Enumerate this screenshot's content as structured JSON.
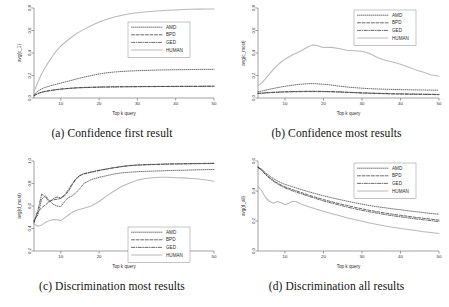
{
  "figure": {
    "panels": [
      {
        "id": "a",
        "caption": "(a) Confidence first result",
        "ylabel": "avg(c_1)",
        "xlabel": "Top k query"
      },
      {
        "id": "b",
        "caption": "(b) Confidence most results",
        "ylabel": "avg(c_most)",
        "xlabel": "Top k query"
      },
      {
        "id": "c",
        "caption": "(c) Discrimination most results",
        "ylabel": "avg(d_most)",
        "xlabel": "Top k query"
      },
      {
        "id": "d",
        "caption": "(d) Discrimination all results",
        "ylabel": "avg(d_all)",
        "xlabel": "Top k query"
      }
    ],
    "legend": {
      "entries": [
        "AMD",
        "BPD",
        "GED",
        "HUMAN"
      ]
    },
    "colors": {
      "amd": "#3a3a3a",
      "bpd": "#3a3a3a",
      "ged": "#3a3a3a",
      "human": "#b9b9b9",
      "axis": "#555555"
    }
  },
  "chart_data": [
    {
      "type": "line",
      "panel": "a",
      "title": "(a) Confidence first result",
      "xlabel": "Top k query",
      "ylabel": "avg(c_1)",
      "xlim": [
        3,
        50
      ],
      "ylim": [
        0.0,
        0.8
      ],
      "xticks": [
        10,
        20,
        30,
        40,
        50
      ],
      "yticks": [
        0.0,
        0.2,
        0.4,
        0.6,
        0.8
      ],
      "grid": false,
      "legend_position": "center-right",
      "x": [
        3,
        4,
        5,
        6,
        7,
        8,
        9,
        10,
        12,
        14,
        16,
        18,
        20,
        22,
        24,
        26,
        28,
        30,
        32,
        34,
        36,
        38,
        40,
        42,
        44,
        46,
        48,
        50
      ],
      "series": [
        {
          "name": "AMD",
          "values": [
            0.03,
            0.06,
            0.082,
            0.095,
            0.105,
            0.115,
            0.124,
            0.133,
            0.15,
            0.168,
            0.185,
            0.2,
            0.214,
            0.224,
            0.231,
            0.236,
            0.24,
            0.243,
            0.245,
            0.247,
            0.249,
            0.25,
            0.251,
            0.252,
            0.253,
            0.254,
            0.254,
            0.255
          ]
        },
        {
          "name": "BPD",
          "values": [
            0.022,
            0.04,
            0.052,
            0.06,
            0.066,
            0.071,
            0.076,
            0.08,
            0.086,
            0.091,
            0.094,
            0.096,
            0.098,
            0.099,
            0.1,
            0.101,
            0.101,
            0.102,
            0.102,
            0.103,
            0.103,
            0.103,
            0.104,
            0.104,
            0.104,
            0.104,
            0.105,
            0.105
          ]
        },
        {
          "name": "GED",
          "values": [
            0.02,
            0.038,
            0.05,
            0.058,
            0.064,
            0.069,
            0.074,
            0.078,
            0.084,
            0.089,
            0.092,
            0.094,
            0.096,
            0.097,
            0.098,
            0.099,
            0.1,
            0.1,
            0.101,
            0.101,
            0.102,
            0.102,
            0.102,
            0.103,
            0.103,
            0.103,
            0.104,
            0.104
          ]
        },
        {
          "name": "HUMAN",
          "values": [
            0.055,
            0.14,
            0.215,
            0.275,
            0.33,
            0.38,
            0.425,
            0.462,
            0.52,
            0.57,
            0.61,
            0.645,
            0.675,
            0.7,
            0.72,
            0.736,
            0.748,
            0.758,
            0.765,
            0.771,
            0.776,
            0.78,
            0.783,
            0.786,
            0.788,
            0.79,
            0.791,
            0.792
          ]
        }
      ]
    },
    {
      "type": "line",
      "panel": "b",
      "title": "(b) Confidence most results",
      "xlabel": "Top k query",
      "ylabel": "avg(c_most)",
      "xlim": [
        3,
        50
      ],
      "ylim": [
        0.0,
        0.8
      ],
      "xticks": [
        10,
        20,
        30,
        40,
        50
      ],
      "yticks": [
        0.0,
        0.2,
        0.4,
        0.6,
        0.8
      ],
      "grid": false,
      "legend_position": "top-right",
      "x": [
        3,
        4,
        5,
        6,
        7,
        8,
        9,
        10,
        12,
        14,
        16,
        17,
        18,
        20,
        22,
        24,
        26,
        28,
        30,
        32,
        34,
        36,
        38,
        40,
        42,
        44,
        46,
        48,
        50
      ],
      "series": [
        {
          "name": "AMD",
          "values": [
            0.055,
            0.062,
            0.07,
            0.078,
            0.085,
            0.092,
            0.098,
            0.104,
            0.114,
            0.122,
            0.127,
            0.128,
            0.127,
            0.122,
            0.115,
            0.106,
            0.098,
            0.092,
            0.087,
            0.083,
            0.08,
            0.078,
            0.076,
            0.074,
            0.073,
            0.072,
            0.071,
            0.07,
            0.07
          ]
        },
        {
          "name": "BPD",
          "values": [
            0.04,
            0.042,
            0.045,
            0.047,
            0.049,
            0.05,
            0.052,
            0.053,
            0.055,
            0.056,
            0.057,
            0.057,
            0.057,
            0.056,
            0.055,
            0.053,
            0.05,
            0.047,
            0.044,
            0.042,
            0.04,
            0.038,
            0.036,
            0.035,
            0.034,
            0.033,
            0.032,
            0.031,
            0.03
          ]
        },
        {
          "name": "GED",
          "values": [
            0.042,
            0.044,
            0.047,
            0.049,
            0.051,
            0.053,
            0.054,
            0.056,
            0.058,
            0.059,
            0.06,
            0.06,
            0.06,
            0.059,
            0.057,
            0.055,
            0.052,
            0.049,
            0.046,
            0.044,
            0.042,
            0.04,
            0.038,
            0.037,
            0.036,
            0.035,
            0.034,
            0.033,
            0.032
          ]
        },
        {
          "name": "HUMAN",
          "values": [
            0.11,
            0.135,
            0.175,
            0.215,
            0.255,
            0.29,
            0.32,
            0.345,
            0.385,
            0.415,
            0.455,
            0.47,
            0.468,
            0.448,
            0.45,
            0.44,
            0.425,
            0.42,
            0.415,
            0.395,
            0.36,
            0.335,
            0.32,
            0.3,
            0.275,
            0.25,
            0.23,
            0.205,
            0.195
          ]
        }
      ]
    },
    {
      "type": "line",
      "panel": "c",
      "title": "(c) Discrimination most results",
      "xlabel": "Top k query",
      "ylabel": "avg(d_most)",
      "xlim": [
        3,
        50
      ],
      "ylim": [
        0.2,
        1.0
      ],
      "xticks": [
        10,
        20,
        30,
        40,
        50
      ],
      "yticks": [
        0.2,
        0.4,
        0.6,
        0.8,
        1.0
      ],
      "grid": false,
      "legend_position": "bottom-right",
      "x": [
        3,
        4,
        5,
        6,
        7,
        8,
        9,
        10,
        11,
        12,
        13,
        14,
        15,
        16,
        18,
        20,
        22,
        24,
        26,
        28,
        30,
        32,
        34,
        36,
        38,
        40,
        42,
        44,
        46,
        48,
        50
      ],
      "series": [
        {
          "name": "AMD",
          "values": [
            0.47,
            0.52,
            0.66,
            0.69,
            0.65,
            0.615,
            0.6,
            0.595,
            0.64,
            0.675,
            0.69,
            0.72,
            0.755,
            0.8,
            0.835,
            0.855,
            0.87,
            0.885,
            0.895,
            0.9,
            0.905,
            0.908,
            0.91,
            0.912,
            0.915,
            0.917,
            0.918,
            0.92,
            0.922,
            0.923,
            0.925
          ]
        },
        {
          "name": "BPD",
          "values": [
            0.45,
            0.545,
            0.585,
            0.61,
            0.64,
            0.655,
            0.66,
            0.668,
            0.69,
            0.73,
            0.79,
            0.84,
            0.87,
            0.885,
            0.9,
            0.915,
            0.928,
            0.94,
            0.95,
            0.958,
            0.963,
            0.966,
            0.968,
            0.97,
            0.972,
            0.973,
            0.974,
            0.975,
            0.976,
            0.977,
            0.978
          ]
        },
        {
          "name": "GED",
          "values": [
            0.46,
            0.56,
            0.705,
            0.68,
            0.635,
            0.665,
            0.68,
            0.672,
            0.7,
            0.745,
            0.8,
            0.845,
            0.872,
            0.888,
            0.903,
            0.918,
            0.93,
            0.942,
            0.952,
            0.96,
            0.965,
            0.968,
            0.97,
            0.972,
            0.974,
            0.975,
            0.976,
            0.977,
            0.978,
            0.979,
            0.98
          ]
        },
        {
          "name": "HUMAN",
          "values": [
            0.44,
            0.42,
            0.43,
            0.455,
            0.47,
            0.48,
            0.478,
            0.47,
            0.495,
            0.52,
            0.545,
            0.56,
            0.572,
            0.58,
            0.6,
            0.64,
            0.69,
            0.735,
            0.775,
            0.805,
            0.83,
            0.845,
            0.852,
            0.855,
            0.855,
            0.852,
            0.85,
            0.845,
            0.84,
            0.832,
            0.82
          ]
        }
      ]
    },
    {
      "type": "line",
      "panel": "d",
      "title": "(d) Discrimination all results",
      "xlabel": "Top k query",
      "ylabel": "avg(d_all)",
      "xlim": [
        3,
        50
      ],
      "ylim": [
        0.0,
        0.6
      ],
      "xticks": [
        10,
        20,
        30,
        40,
        50
      ],
      "yticks": [
        0.0,
        0.2,
        0.4,
        0.6
      ],
      "grid": false,
      "legend_position": "top-right",
      "x": [
        3,
        4,
        5,
        6,
        7,
        8,
        9,
        10,
        11,
        12,
        13,
        14,
        16,
        18,
        20,
        22,
        24,
        26,
        28,
        30,
        32,
        34,
        36,
        38,
        40,
        42,
        44,
        46,
        48,
        50
      ],
      "series": [
        {
          "name": "AMD",
          "values": [
            0.56,
            0.545,
            0.52,
            0.5,
            0.482,
            0.468,
            0.455,
            0.444,
            0.436,
            0.428,
            0.42,
            0.412,
            0.396,
            0.382,
            0.368,
            0.356,
            0.344,
            0.333,
            0.322,
            0.312,
            0.303,
            0.295,
            0.288,
            0.281,
            0.275,
            0.268,
            0.262,
            0.256,
            0.25,
            0.245
          ]
        },
        {
          "name": "BPD",
          "values": [
            0.558,
            0.54,
            0.512,
            0.49,
            0.47,
            0.454,
            0.44,
            0.428,
            0.418,
            0.409,
            0.4,
            0.392,
            0.374,
            0.358,
            0.343,
            0.329,
            0.316,
            0.304,
            0.292,
            0.281,
            0.271,
            0.262,
            0.253,
            0.245,
            0.238,
            0.231,
            0.224,
            0.218,
            0.212,
            0.206
          ]
        },
        {
          "name": "GED",
          "values": [
            0.556,
            0.538,
            0.508,
            0.485,
            0.465,
            0.448,
            0.433,
            0.421,
            0.411,
            0.401,
            0.392,
            0.384,
            0.366,
            0.35,
            0.334,
            0.32,
            0.307,
            0.294,
            0.282,
            0.271,
            0.261,
            0.252,
            0.243,
            0.235,
            0.228,
            0.221,
            0.214,
            0.208,
            0.202,
            0.196
          ]
        },
        {
          "name": "HUMAN",
          "values": [
            0.43,
            0.4,
            0.355,
            0.33,
            0.318,
            0.33,
            0.322,
            0.308,
            0.318,
            0.332,
            0.328,
            0.315,
            0.296,
            0.28,
            0.265,
            0.25,
            0.236,
            0.222,
            0.21,
            0.198,
            0.186,
            0.176,
            0.167,
            0.158,
            0.15,
            0.143,
            0.136,
            0.129,
            0.123,
            0.117
          ]
        }
      ]
    }
  ]
}
